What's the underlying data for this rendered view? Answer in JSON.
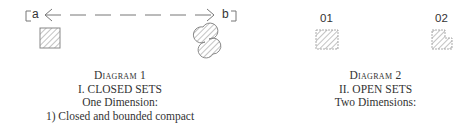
{
  "diagram1": {
    "endpoint_a": "a",
    "endpoint_b": "b",
    "caption": {
      "title": "Diagram 1",
      "section": "I. CLOSED SETS",
      "subtitle": "One Dimension:",
      "item": "1) Closed and bounded compact"
    }
  },
  "diagram2": {
    "shape1_label": "01",
    "shape2_label": "02",
    "caption": {
      "title": "Diagram 2",
      "section": "II. OPEN SETS",
      "subtitle": "Two Dimensions:"
    }
  },
  "colors": {
    "stroke": "#777777",
    "hatch": "#888888",
    "text": "#333333"
  }
}
